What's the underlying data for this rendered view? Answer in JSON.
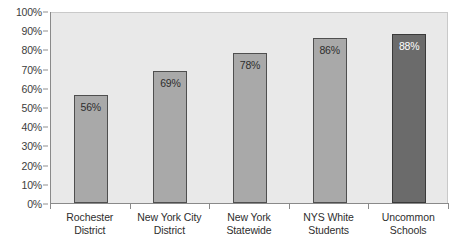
{
  "chart_data": {
    "type": "bar",
    "title": "",
    "xlabel": "",
    "ylabel": "",
    "ylim": [
      0,
      100
    ],
    "grid": false,
    "legend": "none",
    "categories": [
      "Rochester District",
      "New York City District",
      "New York Statewide",
      "NYS White Students",
      "Uncommon Schools"
    ],
    "category_lines": [
      [
        "Rochester",
        "District"
      ],
      [
        "New York City",
        "District"
      ],
      [
        "New York",
        "Statewide"
      ],
      [
        "NYS White",
        "Students"
      ],
      [
        "Uncommon",
        "Schools"
      ]
    ],
    "values": [
      56,
      69,
      78,
      86,
      88
    ],
    "data_labels": [
      "56%",
      "69%",
      "78%",
      "86%",
      "88%"
    ],
    "bar_colors": [
      "#a9a9a9",
      "#a9a9a9",
      "#a9a9a9",
      "#a9a9a9",
      "#6b6b6b"
    ],
    "label_colors": [
      "#2e2e2e",
      "#2e2e2e",
      "#2e2e2e",
      "#2e2e2e",
      "#ffffff"
    ],
    "y_ticks": [
      "0%",
      "10%",
      "20%",
      "30%",
      "40%",
      "50%",
      "60%",
      "70%",
      "80%",
      "90%",
      "100%"
    ],
    "y_tick_values": [
      0,
      10,
      20,
      30,
      40,
      50,
      60,
      70,
      80,
      90,
      100
    ]
  },
  "style": {
    "plot_background": "#e9e9e9",
    "axis_color": "#8a8a8a",
    "bar_fill": "#a9a9a9",
    "bar_fill_highlight": "#6b6b6b",
    "bar_border": "#4f4f4f",
    "text_color": "#2e2e2e"
  },
  "title_remnant": ""
}
